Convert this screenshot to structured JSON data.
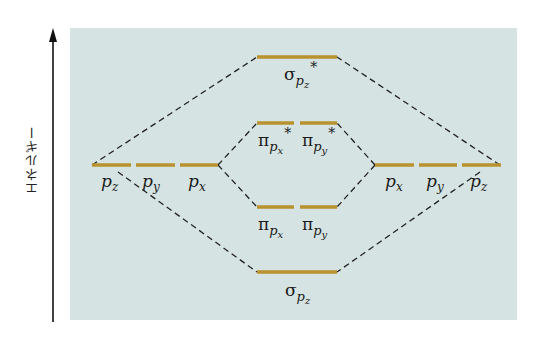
{
  "axis": {
    "label": "エネルギー",
    "direction": "up"
  },
  "colors": {
    "panel_background": "#d6e3e3",
    "level_color": "#b8922e",
    "dash_color": "#222222",
    "axis_color": "#111111"
  },
  "left_atom": {
    "orbitals": [
      {
        "base": "p",
        "sub": "z"
      },
      {
        "base": "p",
        "sub": "y"
      },
      {
        "base": "p",
        "sub": "x"
      }
    ]
  },
  "right_atom": {
    "orbitals": [
      {
        "base": "p",
        "sub": "x"
      },
      {
        "base": "p",
        "sub": "y"
      },
      {
        "base": "p",
        "sub": "z"
      }
    ]
  },
  "molecular_orbitals": {
    "sigma_star": {
      "symbol": "σ",
      "sub_base": "p",
      "sub_index": "z",
      "star": "*"
    },
    "pi_star_x": {
      "symbol": "π",
      "sub_base": "p",
      "sub_index": "x",
      "star": "*"
    },
    "pi_star_y": {
      "symbol": "π",
      "sub_base": "p",
      "sub_index": "y",
      "star": "*"
    },
    "pi_x": {
      "symbol": "π",
      "sub_base": "p",
      "sub_index": "x"
    },
    "pi_y": {
      "symbol": "π",
      "sub_base": "p",
      "sub_index": "y"
    },
    "sigma": {
      "symbol": "σ",
      "sub_base": "p",
      "sub_index": "z"
    }
  }
}
